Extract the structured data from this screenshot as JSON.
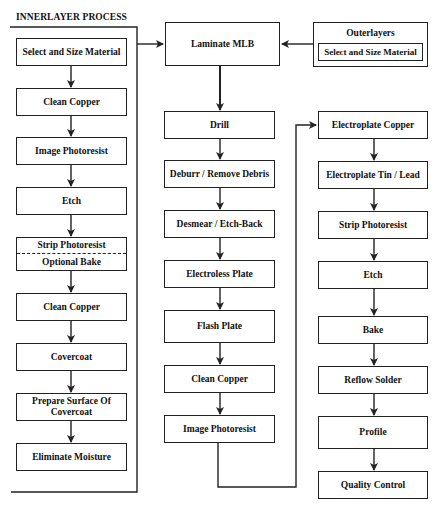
{
  "innerlayer": {
    "title": "INNERLAYER PROCESS",
    "steps": [
      "Select and Size Material",
      "Clean Copper",
      "Image Photoresist",
      "Etch",
      "Strip Photoresist",
      "Clean Copper",
      "Covercoat",
      "Prepare Surface Of Covercoat",
      "Eliminate Moisture"
    ],
    "optional_step": "Optional Bake"
  },
  "outerlayers": {
    "title": "Outerlayers",
    "step": "Select and Size Material"
  },
  "middle_column": {
    "steps": [
      "Laminate MLB",
      "Drill",
      "Deburr / Remove Debris",
      "Desmear / Etch-Back",
      "Electroless Plate",
      "Flash Plate",
      "Clean Copper",
      "Image Photoresist"
    ]
  },
  "right_column": {
    "steps": [
      "Electroplate Copper",
      "Electroplate Tin / Lead",
      "Strip Photoresist",
      "Etch",
      "Bake",
      "Reflow Solder",
      "Profile",
      "Quality Control"
    ]
  }
}
